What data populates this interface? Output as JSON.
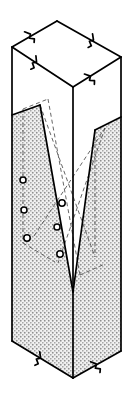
{
  "figure": {
    "width": 133,
    "height": 399,
    "background_color": "#ffffff",
    "line_color": "#000000",
    "stipple_color": "#9a9a9a",
    "face_color": "#ffffff",
    "hidden_line_color": "#555555",
    "hole_fill_color": "#ffffff",
    "hole_stroke_color": "#000000"
  },
  "geometry": {
    "top_face": {
      "name": "top-face",
      "points": "12,47 57,21 121,57 73,87"
    },
    "left_face": {
      "name": "left-face-front-left",
      "points": "12,47 73,87 73,378 12,341"
    },
    "right_face": {
      "name": "right-face-front-right",
      "points": "73,87 121,57 121,351 73,378"
    },
    "left_stipple": {
      "name": "left-face-stipple-region",
      "points": "12,115 40,105 73,292 73,378 12,341"
    },
    "right_stipple": {
      "name": "right-face-stipple-region",
      "points": "95,130 121,117 121,351 73,378 73,292"
    },
    "notch_left_panel": {
      "name": "notch-left-sloping-face",
      "points": "40,105 73,87 73,292"
    },
    "notch_right_panel": {
      "name": "notch-right-sloping-face",
      "points": "73,87 121,57 121,117 95,130 73,292"
    },
    "notch_inner_left": {
      "name": "notch-inner-left-wall",
      "points": "12,115 40,105 73,292 73,292"
    }
  },
  "solid_lines": [
    {
      "name": "edge-top-back-left",
      "d": "M12,47 L57,21"
    },
    {
      "name": "edge-top-back-right",
      "d": "M57,21 L121,57"
    },
    {
      "name": "edge-top-front-left",
      "d": "M12,47 L73,87"
    },
    {
      "name": "edge-top-front-right",
      "d": "M73,87 L121,57"
    },
    {
      "name": "edge-vertical-left",
      "d": "M12,47 L12,341"
    },
    {
      "name": "edge-vertical-front",
      "d": "M73,87 L73,292"
    },
    {
      "name": "edge-vertical-front-lower",
      "d": "M73,292 L73,378"
    },
    {
      "name": "edge-vertical-right",
      "d": "M121,57 L121,351"
    },
    {
      "name": "edge-bottom-left",
      "d": "M12,341 L73,378"
    },
    {
      "name": "edge-bottom-right",
      "d": "M73,378 L121,351"
    },
    {
      "name": "notch-left-slope",
      "d": "M40,105 L73,292"
    },
    {
      "name": "notch-left-top",
      "d": "M12,115 L40,105"
    },
    {
      "name": "notch-right-top",
      "d": "M95,130 L121,117"
    },
    {
      "name": "notch-right-slope",
      "d": "M95,130 L73,292"
    }
  ],
  "hidden_lines": [
    {
      "name": "hidden-notch-back-left-top",
      "d": "M23,109 L48,99"
    },
    {
      "name": "hidden-notch-back-left-slope",
      "d": "M48,99 L80,275"
    },
    {
      "name": "hidden-notch-vertical-left",
      "d": "M23,109 L23,243"
    },
    {
      "name": "hidden-notch-floor-left",
      "d": "M23,243 L55,262"
    },
    {
      "name": "hidden-notch-back-right-slope",
      "d": "M105,128 L58,263"
    },
    {
      "name": "hidden-notch-diagonal-a",
      "d": "M40,105 L95,257"
    },
    {
      "name": "hidden-notch-diagonal-b",
      "d": "M34,236 L105,128"
    },
    {
      "name": "hidden-notch-bottom-right",
      "d": "M80,275 L105,264"
    },
    {
      "name": "hidden-right-lower-edge",
      "d": "M95,130 L95,257"
    }
  ],
  "break_symbols": [
    {
      "name": "break-symbol-top-back-left",
      "x": 31,
      "y": 35,
      "angle": -30
    },
    {
      "name": "break-symbol-top-back-right",
      "x": 93,
      "y": 41,
      "angle": 30
    },
    {
      "name": "break-symbol-top-front-left",
      "x": 36,
      "y": 63,
      "angle": 33
    },
    {
      "name": "break-symbol-top-front-right",
      "x": 91,
      "y": 77,
      "angle": -32
    },
    {
      "name": "break-symbol-bottom-left",
      "x": 40,
      "y": 359,
      "angle": 32
    },
    {
      "name": "break-symbol-bottom-right",
      "x": 97,
      "y": 365,
      "angle": -29
    }
  ],
  "holes": [
    {
      "name": "hole-left-face-1",
      "cx": 23,
      "cy": 180,
      "r": 3.0
    },
    {
      "name": "hole-left-face-2",
      "cx": 24,
      "cy": 210,
      "r": 3.0
    },
    {
      "name": "hole-left-face-3",
      "cx": 27,
      "cy": 238,
      "r": 3.2
    },
    {
      "name": "hole-center-upper",
      "cx": 62,
      "cy": 203,
      "r": 3.2
    },
    {
      "name": "hole-center-middle",
      "cx": 57,
      "cy": 227,
      "r": 3.0
    },
    {
      "name": "hole-center-lower",
      "cx": 60,
      "cy": 254,
      "r": 3.2
    }
  ]
}
